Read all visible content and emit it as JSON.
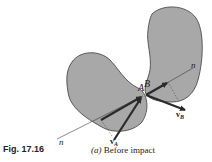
{
  "figure": {
    "number": "Fig. 17.16",
    "caption_part": "(a)",
    "caption_text": "Before impact"
  },
  "labels": {
    "point_a": "A",
    "point_b": "B",
    "normal_left": "n",
    "normal_right": "n",
    "velocity_a_main": "v",
    "velocity_a_sub": "A",
    "velocity_b_main": "v",
    "velocity_b_sub": "B"
  },
  "colors": {
    "body_fill": "#a8a8a8",
    "outline": "#3a3a3a",
    "vector": "#2a2a2a"
  }
}
